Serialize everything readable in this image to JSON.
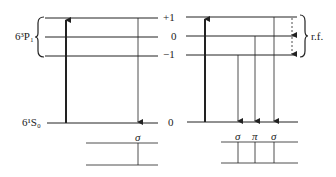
{
  "diagram": {
    "excited_state_label": "6³P₁",
    "ground_state_label": "6¹S₀",
    "m_levels": [
      "+1",
      "0",
      "−1"
    ],
    "ground_m_level": "0",
    "rf_label": "r.f.",
    "left_spectrum_lines": [
      "σ"
    ],
    "right_spectrum_lines": [
      "σ",
      "π",
      "σ"
    ],
    "colors": {
      "line": "#222222",
      "background": "#ffffff"
    }
  }
}
